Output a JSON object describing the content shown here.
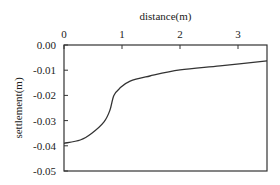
{
  "chart_data": {
    "type": "line",
    "title": "",
    "xlabel": "distance(m)",
    "ylabel": "settlement(m)",
    "xlim": [
      0,
      3.5
    ],
    "ylim": [
      -0.05,
      0.0
    ],
    "x_ticks": [
      "0",
      "1",
      "2",
      "3"
    ],
    "y_ticks": [
      "0.00",
      "-0.01",
      "-0.02",
      "-0.03",
      "-0.04",
      "-0.05"
    ],
    "x_axis_position": "top",
    "grid": false,
    "legend": null,
    "series": [
      {
        "name": "settlement",
        "x": [
          0,
          0.28,
          0.48,
          0.69,
          0.79,
          0.86,
          0.97,
          1.14,
          1.48,
          2.0,
          2.69,
          3.5
        ],
        "y": [
          -0.039,
          -0.0377,
          -0.035,
          -0.0305,
          -0.026,
          -0.02,
          -0.017,
          -0.0143,
          -0.0123,
          -0.0099,
          -0.0083,
          -0.0063
        ]
      }
    ]
  }
}
